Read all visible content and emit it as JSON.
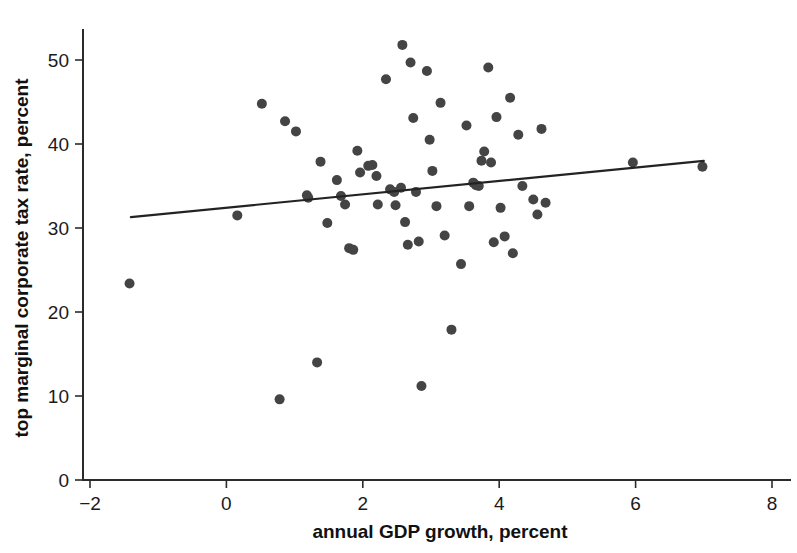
{
  "chart_data": {
    "type": "scatter",
    "title": "",
    "xlabel": "annual GDP growth, percent",
    "ylabel": "top marginal corporate tax rate, percent",
    "xlim": [
      -2.6,
      8.4
    ],
    "ylim": [
      0,
      53
    ],
    "xticks": [
      -2,
      0,
      2,
      4,
      6,
      8
    ],
    "xtick_labels": [
      "−2",
      "0",
      "2",
      "4",
      "6",
      "8"
    ],
    "yticks": [
      0,
      10,
      20,
      30,
      40,
      50
    ],
    "ytick_labels": [
      "0",
      "10",
      "20",
      "30",
      "40",
      "50"
    ],
    "grid": false,
    "legend": null,
    "marker_color": "#444444",
    "axis_color": "#2b2b2b",
    "point_radius_px": 5,
    "points": [
      {
        "x": -1.42,
        "y": 23.4
      },
      {
        "x": 0.16,
        "y": 31.5
      },
      {
        "x": 0.52,
        "y": 44.8
      },
      {
        "x": 0.78,
        "y": 9.6
      },
      {
        "x": 0.86,
        "y": 42.7
      },
      {
        "x": 1.02,
        "y": 41.5
      },
      {
        "x": 1.18,
        "y": 33.9
      },
      {
        "x": 1.2,
        "y": 33.6
      },
      {
        "x": 1.33,
        "y": 14.0
      },
      {
        "x": 1.38,
        "y": 37.9
      },
      {
        "x": 1.48,
        "y": 30.6
      },
      {
        "x": 1.62,
        "y": 35.7
      },
      {
        "x": 1.68,
        "y": 33.8
      },
      {
        "x": 1.74,
        "y": 32.8
      },
      {
        "x": 1.8,
        "y": 27.6
      },
      {
        "x": 1.86,
        "y": 27.4
      },
      {
        "x": 1.92,
        "y": 39.2
      },
      {
        "x": 1.96,
        "y": 36.6
      },
      {
        "x": 2.08,
        "y": 37.4
      },
      {
        "x": 2.14,
        "y": 37.5
      },
      {
        "x": 2.2,
        "y": 36.2
      },
      {
        "x": 2.22,
        "y": 32.8
      },
      {
        "x": 2.34,
        "y": 47.7
      },
      {
        "x": 2.4,
        "y": 34.6
      },
      {
        "x": 2.46,
        "y": 34.3
      },
      {
        "x": 2.48,
        "y": 32.7
      },
      {
        "x": 2.56,
        "y": 34.8
      },
      {
        "x": 2.58,
        "y": 51.8
      },
      {
        "x": 2.62,
        "y": 30.7
      },
      {
        "x": 2.66,
        "y": 28.0
      },
      {
        "x": 2.7,
        "y": 49.7
      },
      {
        "x": 2.74,
        "y": 43.1
      },
      {
        "x": 2.78,
        "y": 34.3
      },
      {
        "x": 2.82,
        "y": 28.4
      },
      {
        "x": 2.86,
        "y": 11.2
      },
      {
        "x": 2.94,
        "y": 48.7
      },
      {
        "x": 2.98,
        "y": 40.5
      },
      {
        "x": 3.02,
        "y": 36.8
      },
      {
        "x": 3.08,
        "y": 32.6
      },
      {
        "x": 3.14,
        "y": 44.9
      },
      {
        "x": 3.2,
        "y": 29.1
      },
      {
        "x": 3.3,
        "y": 17.9
      },
      {
        "x": 3.44,
        "y": 25.7
      },
      {
        "x": 3.52,
        "y": 42.2
      },
      {
        "x": 3.56,
        "y": 32.6
      },
      {
        "x": 3.62,
        "y": 35.4
      },
      {
        "x": 3.66,
        "y": 35.1
      },
      {
        "x": 3.7,
        "y": 35.0
      },
      {
        "x": 3.74,
        "y": 38.0
      },
      {
        "x": 3.78,
        "y": 39.1
      },
      {
        "x": 3.84,
        "y": 49.1
      },
      {
        "x": 3.88,
        "y": 37.8
      },
      {
        "x": 3.92,
        "y": 28.3
      },
      {
        "x": 3.96,
        "y": 43.2
      },
      {
        "x": 4.02,
        "y": 32.4
      },
      {
        "x": 4.08,
        "y": 29.0
      },
      {
        "x": 4.16,
        "y": 45.5
      },
      {
        "x": 4.2,
        "y": 27.0
      },
      {
        "x": 4.28,
        "y": 41.1
      },
      {
        "x": 4.34,
        "y": 35.0
      },
      {
        "x": 4.5,
        "y": 33.4
      },
      {
        "x": 4.56,
        "y": 31.6
      },
      {
        "x": 4.62,
        "y": 41.8
      },
      {
        "x": 4.68,
        "y": 33.0
      },
      {
        "x": 5.96,
        "y": 37.8
      },
      {
        "x": 6.98,
        "y": 37.3
      }
    ],
    "trend_line": {
      "x_start": -1.4,
      "y_start": 31.3,
      "x_end": 7.0,
      "y_end": 38.0
    }
  }
}
